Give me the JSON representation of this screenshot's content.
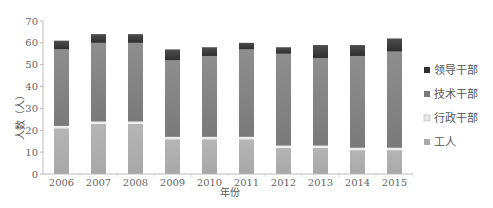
{
  "chart_data": {
    "type": "bar",
    "stacked": true,
    "title": "",
    "xlabel": "年份",
    "ylabel": "人数（人）",
    "ylim": [
      0,
      70
    ],
    "yticks": [
      0,
      10,
      20,
      30,
      40,
      50,
      60,
      70
    ],
    "grid": false,
    "legend_position": "right",
    "categories": [
      "2006",
      "2007",
      "2008",
      "2009",
      "2010",
      "2011",
      "2012",
      "2013",
      "2014",
      "2015"
    ],
    "series": [
      {
        "name": "工人",
        "color": "#a8a8a8",
        "values": [
          21,
          23,
          23,
          16,
          16,
          16,
          12,
          12,
          11,
          11
        ]
      },
      {
        "name": "行政干部",
        "color": "#e8e8e8",
        "values": [
          1,
          1,
          1,
          1,
          1,
          1,
          1,
          1,
          1,
          1
        ]
      },
      {
        "name": "技术干部",
        "color": "#7a7a7a",
        "values": [
          35,
          36,
          36,
          35,
          37,
          40,
          42,
          40,
          42,
          44
        ]
      },
      {
        "name": "领导干部",
        "color": "#2e2e2e",
        "values": [
          4,
          4,
          4,
          5,
          4,
          3,
          3,
          6,
          5,
          6
        ]
      }
    ],
    "totals": [
      61,
      64,
      64,
      57,
      58,
      60,
      58,
      59,
      59,
      62
    ]
  },
  "legend": [
    {
      "label": "领导干部",
      "color": "#2e2e2e"
    },
    {
      "label": "技术干部",
      "color": "#7a7a7a"
    },
    {
      "label": "行政干部",
      "color": "#e8e8e8"
    },
    {
      "label": "工人",
      "color": "#a8a8a8"
    }
  ]
}
